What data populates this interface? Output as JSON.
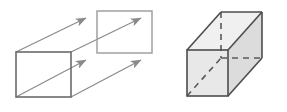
{
  "figure": {
    "title": "Translation of a rectangle to form a rectangular prism",
    "width": 287,
    "height": 112,
    "background_color": "#ffffff",
    "panels": [
      {
        "id": "left-panel",
        "name": "translation-diagram",
        "description": "A rectangle translated along four parallel arrows to a second congruent rectangle",
        "shapes": {
          "front_rectangle": {
            "name": "front-rectangle",
            "x": 16,
            "y": 52,
            "width": 55,
            "height": 45,
            "stroke_color": "#6b6b6b",
            "fill_color": "none",
            "stroke_width": 1.6
          },
          "back_rectangle": {
            "name": "back-rectangle",
            "x": 97,
            "y": 11,
            "width": 55,
            "height": 42,
            "stroke_color": "#9a9a9a",
            "fill_color": "none",
            "stroke_width": 1.4
          }
        },
        "arrows": [
          {
            "name": "translation-arrow-top-left",
            "x1": 16,
            "y1": 52,
            "x2": 86,
            "y2": 18
          },
          {
            "name": "translation-arrow-bottom-left",
            "x1": 16,
            "y1": 97,
            "x2": 86,
            "y2": 60
          },
          {
            "name": "translation-arrow-top-right",
            "x1": 71,
            "y1": 52,
            "x2": 141,
            "y2": 18
          },
          {
            "name": "translation-arrow-bottom-right",
            "x1": 71,
            "y1": 97,
            "x2": 141,
            "y2": 60
          }
        ],
        "arrow_color": "#8a8a8a",
        "arrow_stroke_width": 1.2
      },
      {
        "id": "right-panel",
        "name": "rectangular-prism-diagram",
        "description": "A shaded rectangular prism drawn in oblique projection with hidden edges dashed",
        "prism": {
          "name": "rectangular-prism",
          "front_face": {
            "name": "prism-front-face",
            "x": 187,
            "y": 50,
            "width": 41,
            "height": 46,
            "fill_color": "#e6e6e6"
          },
          "top_face": {
            "name": "prism-top-face",
            "fill_color": "#f0f0f0"
          },
          "side_face": {
            "name": "prism-side-face",
            "fill_color": "#dedede"
          },
          "depth_offset": {
            "dx": 34,
            "dy": -38
          },
          "edge_color": "#4d4d4d",
          "edge_width": 1.6,
          "hidden_edge_color": "#5a5a5a",
          "hidden_edge_width": 1.6,
          "hidden_edge_dash": "6 5"
        }
      }
    ]
  }
}
